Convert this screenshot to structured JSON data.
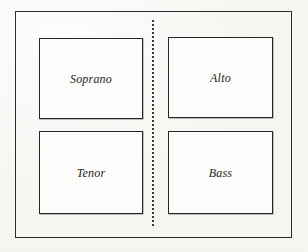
{
  "figure": {
    "kind": "choir-seating-diagram",
    "background_color": "#f7f6f2",
    "ink_color": "#262626"
  },
  "outer_frame": {
    "name": "outer-frame",
    "border_color": "#2b2b2b"
  },
  "divider": {
    "name": "center-divider",
    "style": "dotted",
    "orientation": "vertical",
    "color": "#3a3a3a"
  },
  "boxes": [
    {
      "id": "soprano",
      "label": "Soprano",
      "quadrant": "top-left",
      "border_color": "#262626",
      "fill_color": "#fdfdfb"
    },
    {
      "id": "alto",
      "label": "Alto",
      "quadrant": "top-right",
      "border_color": "#262626",
      "fill_color": "#fdfdfb"
    },
    {
      "id": "tenor",
      "label": "Tenor",
      "quadrant": "bottom-left",
      "border_color": "#262626",
      "fill_color": "#fdfdfb"
    },
    {
      "id": "bass",
      "label": "Bass",
      "quadrant": "bottom-right",
      "border_color": "#262626",
      "fill_color": "#fdfdfb"
    }
  ]
}
